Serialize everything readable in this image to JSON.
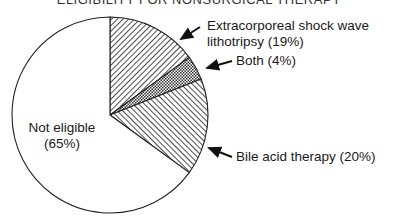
{
  "chart_data": {
    "type": "pie",
    "title": "ELIGIBILITY FOR NONSURGICAL THERAPY",
    "slices": [
      {
        "name": "Extracorporeal shock wave lithotripsy only",
        "value": 15,
        "fill": "hatch-forward"
      },
      {
        "name": "Both",
        "value": 4,
        "fill": "crosshatch"
      },
      {
        "name": "Bile acid therapy only",
        "value": 16,
        "fill": "hatch-back"
      },
      {
        "name": "Not eligible",
        "value": 65,
        "fill": "white"
      }
    ],
    "labels": [
      {
        "lines": [
          "Extracorporeal shock wave",
          "lithotripsy (19%)"
        ],
        "value": 19
      },
      {
        "lines": [
          "Both (4%)"
        ],
        "value": 4
      },
      {
        "lines": [
          "Bile acid therapy (20%)"
        ],
        "value": 20
      },
      {
        "lines": [
          "Not eligible",
          "(65%)"
        ],
        "value": 65
      }
    ],
    "start": "top",
    "direction": "clockwise"
  }
}
